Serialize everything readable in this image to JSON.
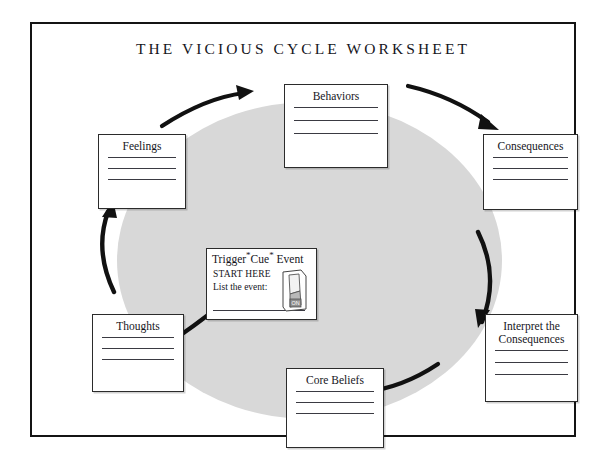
{
  "page": {
    "title": "THE VICIOUS CYCLE WORKSHEET",
    "frame_color": "#141414",
    "ellipse_color": "#d8d8d8",
    "arrow_color": "#111111",
    "ink_color": "#15151c"
  },
  "boxes": [
    {
      "id": "behaviors",
      "label": "Behaviors",
      "lines": 3
    },
    {
      "id": "feelings",
      "label": "Feelings",
      "lines": 3
    },
    {
      "id": "consequences",
      "label": "Consequences",
      "lines": 3
    },
    {
      "id": "interpret",
      "label": "Interpret the Consequences",
      "label_line_1": "Interpret the",
      "label_line_2": "Consequences",
      "lines": 3
    },
    {
      "id": "core-beliefs",
      "label": "Core Beliefs",
      "lines": 3
    },
    {
      "id": "thoughts",
      "label": "Thoughts",
      "lines": 3
    }
  ],
  "trigger": {
    "heading_part_1": "Trigger",
    "heading_star_1": "*",
    "heading_part_2": "Cue",
    "heading_star_2": "*",
    "heading_part_3": " Event",
    "start_here": "START HERE",
    "list_prompt": "List the event:",
    "icon_name": "light-switch-icon",
    "icon_label": "ON"
  },
  "arrows": [
    {
      "id": "behaviors-to-feelings",
      "direction": "counter-clockwise",
      "position": "top-left"
    },
    {
      "id": "consequences-to-behaviors",
      "direction": "counter-clockwise",
      "position": "top-right"
    },
    {
      "id": "feelings-to-thoughts",
      "direction": "counter-clockwise",
      "position": "left"
    },
    {
      "id": "interpret-to-consequences",
      "direction": "counter-clockwise",
      "position": "right"
    },
    {
      "id": "thoughts-to-corebeliefs",
      "direction": "counter-clockwise",
      "position": "bottom-left"
    },
    {
      "id": "corebeliefs-to-interpret",
      "direction": "counter-clockwise",
      "position": "bottom-right"
    }
  ]
}
